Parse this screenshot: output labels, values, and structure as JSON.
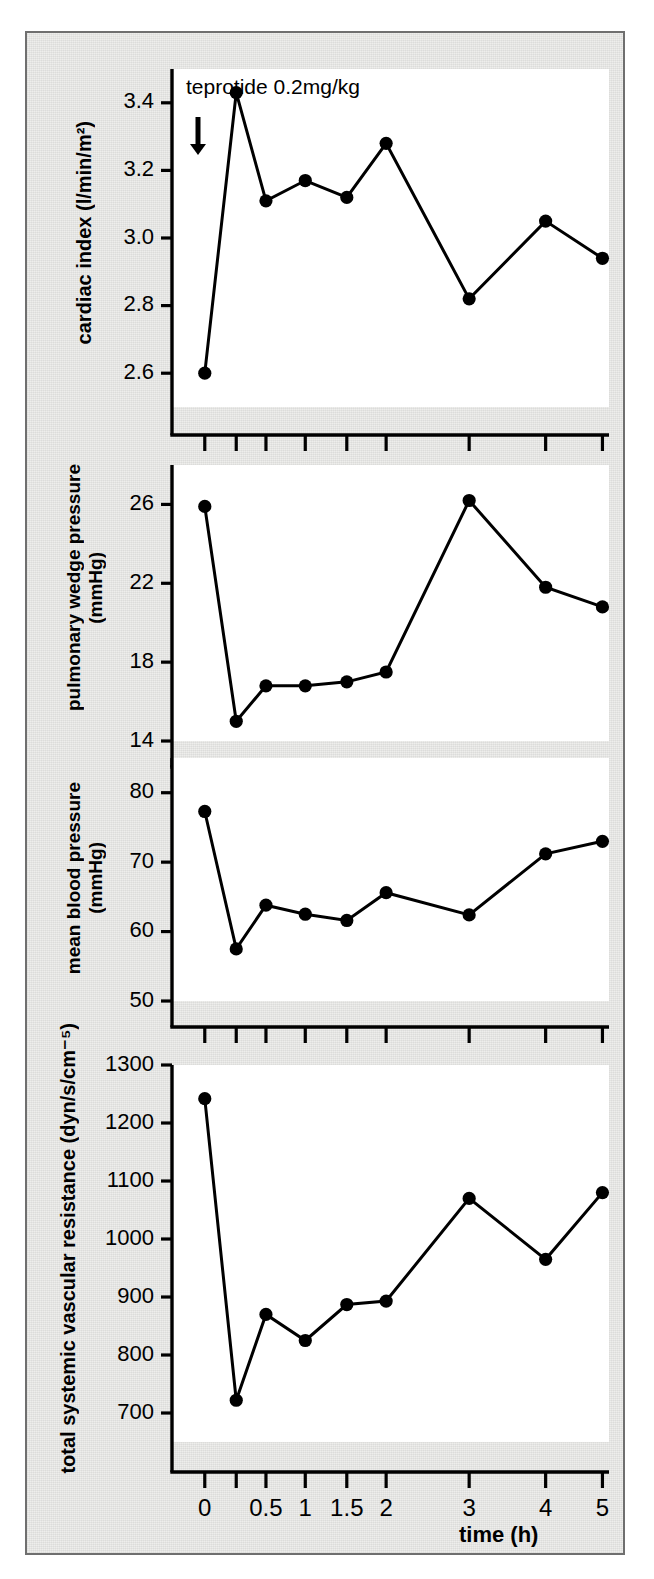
{
  "figure": {
    "annotation": "teprotide 0.2mg/kg",
    "arrow_icon": "down-arrow-icon",
    "xlabel": "time (h)",
    "x_categories": [
      "0",
      "0.25",
      "0.5",
      "1",
      "1.5",
      "2",
      "3",
      "4",
      "5"
    ],
    "x_tick_labels": [
      "0",
      "",
      "0.5",
      "1",
      "1.5",
      "2",
      "3",
      "4",
      "5"
    ],
    "ink_color": "#000000",
    "panel_bg": "#ffffff",
    "figure_bg": "#eeeeec",
    "border_color": "#6f6f6f"
  },
  "chart_data": [
    {
      "type": "line",
      "title": "",
      "ylabel": "cardiac index (l/min/m²)",
      "ylabel_lines": [
        "cardiac index (l/min/m²)"
      ],
      "xlabel": "time (h)",
      "x": [
        0,
        0.25,
        0.5,
        1,
        1.5,
        2,
        3,
        4,
        5
      ],
      "x_tick_labels": [
        "0",
        "",
        "0.5",
        "1",
        "1.5",
        "2",
        "3",
        "4",
        "5"
      ],
      "values": [
        2.6,
        3.43,
        3.11,
        3.17,
        3.12,
        3.28,
        2.82,
        3.05,
        2.94
      ],
      "ylim": [
        2.5,
        3.5
      ],
      "yticks": [
        2.6,
        2.8,
        3.0,
        3.2,
        3.4
      ],
      "ytick_labels": [
        "2.6",
        "2.8",
        "3.0",
        "3.2",
        "3.4"
      ],
      "grid": false,
      "legend": "none",
      "annotation": "teprotide 0.2mg/kg"
    },
    {
      "type": "line",
      "title": "",
      "ylabel": "pulmonary wedge pressure (mmHg)",
      "ylabel_lines": [
        "pulmonary wedge pressure",
        "(mmHg)"
      ],
      "xlabel": "time (h)",
      "x": [
        0,
        0.25,
        0.5,
        1,
        1.5,
        2,
        3,
        4,
        5
      ],
      "x_tick_labels": [
        "0",
        "",
        "0.5",
        "1",
        "1.5",
        "2",
        "3",
        "4",
        "5"
      ],
      "values": [
        25.9,
        15.0,
        16.8,
        16.8,
        17.0,
        17.5,
        26.2,
        21.8,
        20.8
      ],
      "ylim": [
        14,
        28
      ],
      "yticks": [
        14,
        18,
        22,
        26
      ],
      "ytick_labels": [
        "14",
        "18",
        "22",
        "26"
      ],
      "grid": false,
      "legend": "none"
    },
    {
      "type": "line",
      "title": "",
      "ylabel": "mean blood pressure (mmHg)",
      "ylabel_lines": [
        "mean blood pressure",
        "(mmHg)"
      ],
      "xlabel": "time (h)",
      "x": [
        0,
        0.25,
        0.5,
        1,
        1.5,
        2,
        3,
        4,
        5
      ],
      "x_tick_labels": [
        "0",
        "",
        "0.5",
        "1",
        "1.5",
        "2",
        "3",
        "4",
        "5"
      ],
      "values": [
        77.3,
        57.5,
        63.8,
        62.5,
        61.6,
        65.6,
        62.4,
        71.2,
        73.0
      ],
      "ylim": [
        50,
        85
      ],
      "yticks": [
        50,
        60,
        70,
        80
      ],
      "ytick_labels": [
        "50",
        "60",
        "70",
        "80"
      ],
      "grid": false,
      "legend": "none"
    },
    {
      "type": "line",
      "title": "",
      "ylabel": "total systemic vascular resistance (dyn/s/cm⁻⁵)",
      "ylabel_lines": [
        "total systemic vascular resistance (dyn/s/cm⁻⁵)"
      ],
      "xlabel": "time (h)",
      "x": [
        0,
        0.25,
        0.5,
        1,
        1.5,
        2,
        3,
        4,
        5
      ],
      "x_tick_labels": [
        "0",
        "",
        "0.5",
        "1",
        "1.5",
        "2",
        "3",
        "4",
        "5"
      ],
      "values": [
        1242,
        722,
        870,
        825,
        887,
        893,
        1070,
        965,
        1080
      ],
      "ylim": [
        650,
        1300
      ],
      "yticks": [
        700,
        800,
        900,
        1000,
        1100,
        1200,
        1300
      ],
      "ytick_labels": [
        "700",
        "800",
        "900",
        "1000",
        "1100",
        "1200",
        "1300"
      ],
      "grid": false,
      "legend": "none"
    }
  ]
}
